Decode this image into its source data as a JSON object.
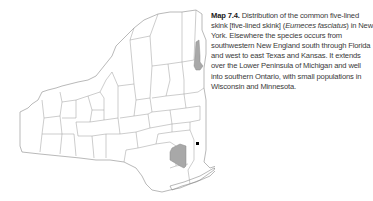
{
  "figure": {
    "map": {
      "region": "New York",
      "legend_colors": {
        "range_fill": "#a8a8a8",
        "record_point": "#000000",
        "county_line": "#9a9a9a"
      },
      "shaded_areas": [
        "Lake Champlain / Washington County area",
        "Orange / Rockland / Sullivan area"
      ],
      "point_records": [
        "Dutchess County locality"
      ]
    },
    "caption": {
      "label": "Map 7.4.",
      "text_before_sci": " Distribution of the common five-lined skink [five-lined skink] (",
      "scientific_name": "Eumeces fasciatus",
      "text_after_sci": ") in New York. Elsewhere the species occurs from southwestern New England south through Florida and west to east Texas and Kansas. It extends over the Lower Peninsula of Michigan and well into southern Ontario, with small populations in Wisconsin and Minnesota."
    }
  }
}
